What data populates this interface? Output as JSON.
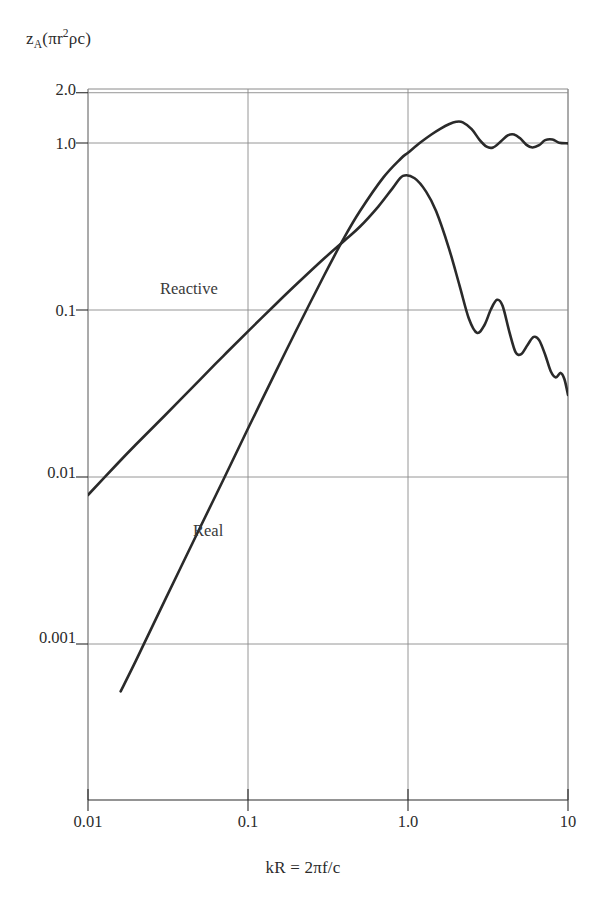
{
  "figure": {
    "background_color": "#ffffff",
    "ink_color": "#2b2b2b",
    "grid_color": "#8a8a8a",
    "curve_color": "#2a2a2a"
  },
  "chart_data": {
    "type": "line",
    "title": "",
    "subtitle": "",
    "xlabel": "kR = 2πf/c",
    "ylabel": "z",
    "ylabel_parts": {
      "symbol": "z",
      "subscript": "A",
      "normalization_open": "(πr",
      "normalization_exponent": "2",
      "normalization_close": "ρc)"
    },
    "ylabel_plain": "z_A(πr²ρc)",
    "xscale": "log",
    "yscale": "log",
    "xlim": [
      0.01,
      10
    ],
    "ylim": [
      0.0005,
      2.0
    ],
    "xticks": [
      "0.01",
      "0.1",
      "1.0",
      "10"
    ],
    "xtick_values": [
      0.01,
      0.1,
      1.0,
      10
    ],
    "yticks": [
      "2.0",
      "1.0",
      "0.1",
      "0.01",
      "0.001"
    ],
    "ytick_values": [
      2.0,
      1.0,
      0.1,
      0.01,
      0.001
    ],
    "grid": true,
    "grid_axes": "both-major",
    "legend": "inline-curve-labels",
    "annotations": [
      {
        "text": "Reactive",
        "x": 0.055,
        "y": 0.135
      },
      {
        "text": "Real",
        "x": 0.105,
        "y": 0.0055
      }
    ],
    "series": [
      {
        "name": "Real",
        "label": "Real",
        "x": [
          0.016,
          0.02,
          0.03,
          0.05,
          0.07,
          0.1,
          0.15,
          0.2,
          0.3,
          0.4,
          0.5,
          0.7,
          0.9,
          1.0,
          1.2,
          1.4,
          1.6,
          1.8,
          2.0,
          2.2,
          2.5,
          2.8,
          3.1,
          3.4,
          3.8,
          4.2,
          4.6,
          5.0,
          5.5,
          6.0,
          6.6,
          7.2,
          8.0,
          8.8,
          10.0
        ],
        "y": [
          0.00052,
          0.0008,
          0.0018,
          0.00495,
          0.0096,
          0.0195,
          0.0432,
          0.0754,
          0.162,
          0.272,
          0.39,
          0.62,
          0.805,
          0.875,
          1.01,
          1.125,
          1.22,
          1.295,
          1.34,
          1.33,
          1.21,
          1.045,
          0.95,
          0.94,
          1.02,
          1.11,
          1.125,
          1.07,
          0.975,
          0.94,
          0.97,
          1.04,
          1.05,
          1.005,
          0.995
        ]
      },
      {
        "name": "Reactive",
        "label": "Reactive",
        "x": [
          0.01,
          0.015,
          0.02,
          0.03,
          0.05,
          0.07,
          0.1,
          0.15,
          0.2,
          0.3,
          0.4,
          0.5,
          0.65,
          0.8,
          0.93,
          1.1,
          1.3,
          1.5,
          1.8,
          2.1,
          2.4,
          2.7,
          3.0,
          3.3,
          3.6,
          3.9,
          4.3,
          4.7,
          5.1,
          5.6,
          6.1,
          6.6,
          7.2,
          7.8,
          8.4,
          9.0,
          9.5,
          10.0
        ],
        "y": [
          0.0078,
          0.0118,
          0.0157,
          0.0232,
          0.0382,
          0.053,
          0.0745,
          0.109,
          0.142,
          0.204,
          0.26,
          0.315,
          0.415,
          0.535,
          0.635,
          0.615,
          0.51,
          0.39,
          0.235,
          0.14,
          0.089,
          0.073,
          0.081,
          0.101,
          0.115,
          0.106,
          0.074,
          0.056,
          0.0545,
          0.062,
          0.069,
          0.066,
          0.054,
          0.043,
          0.0395,
          0.042,
          0.0385,
          0.031
        ]
      }
    ]
  }
}
